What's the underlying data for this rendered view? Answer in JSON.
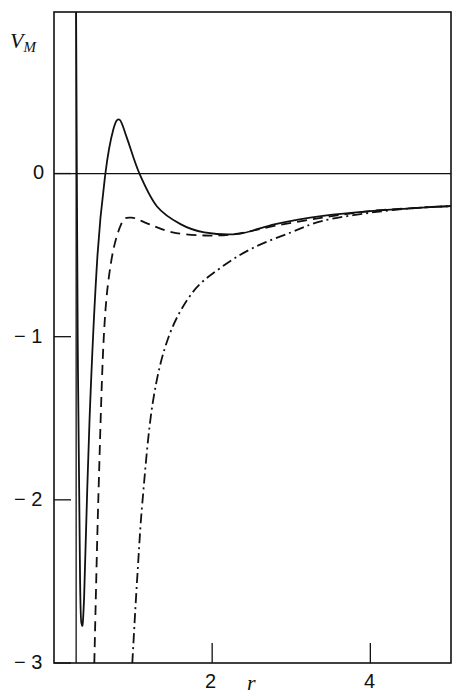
{
  "chart_data": {
    "type": "line",
    "title": "",
    "xlabel": "r",
    "ylabel": "V",
    "ylabel_subscript": "M",
    "xlim": [
      0,
      5.02
    ],
    "ylim": [
      -3,
      0.99
    ],
    "xticks": [
      2,
      4
    ],
    "xtick_labels": [
      "2",
      "4"
    ],
    "yticks": [
      0,
      -1,
      -2,
      -3
    ],
    "ytick_labels": [
      "0",
      "− 1",
      "− 2",
      "− 3"
    ],
    "grid": false,
    "legend": null,
    "annotations": [
      {
        "type": "vline",
        "x": 0.28,
        "style": "solid",
        "note": "hard-core wall"
      },
      {
        "type": "hline",
        "y": 0,
        "style": "solid"
      }
    ],
    "series": [
      {
        "name": "solid",
        "style": "solid",
        "points": [
          [
            0.28,
            0.99
          ],
          [
            0.3,
            -1.0
          ],
          [
            0.33,
            -2.5
          ],
          [
            0.35,
            -2.76
          ],
          [
            0.38,
            -2.6
          ],
          [
            0.45,
            -1.5
          ],
          [
            0.55,
            -0.5
          ],
          [
            0.65,
            0.0
          ],
          [
            0.75,
            0.27
          ],
          [
            0.83,
            0.33
          ],
          [
            0.92,
            0.22
          ],
          [
            1.08,
            0.0
          ],
          [
            1.3,
            -0.2
          ],
          [
            1.6,
            -0.31
          ],
          [
            1.9,
            -0.36
          ],
          [
            2.33,
            -0.37
          ],
          [
            2.8,
            -0.31
          ],
          [
            3.4,
            -0.26
          ],
          [
            4.0,
            -0.23
          ],
          [
            4.6,
            -0.21
          ],
          [
            5.02,
            -0.2
          ]
        ]
      },
      {
        "name": "dashed",
        "style": "dashed",
        "points": [
          [
            0.51,
            -3.0
          ],
          [
            0.56,
            -2.0
          ],
          [
            0.63,
            -1.0
          ],
          [
            0.72,
            -0.55
          ],
          [
            0.85,
            -0.31
          ],
          [
            0.98,
            -0.27
          ],
          [
            1.2,
            -0.31
          ],
          [
            1.5,
            -0.36
          ],
          [
            1.9,
            -0.38
          ],
          [
            2.3,
            -0.37
          ],
          [
            2.8,
            -0.32
          ],
          [
            3.4,
            -0.27
          ],
          [
            4.0,
            -0.23
          ],
          [
            4.6,
            -0.21
          ],
          [
            5.02,
            -0.2
          ]
        ]
      },
      {
        "name": "dash-dot",
        "style": "dashdot",
        "points": [
          [
            0.99,
            -3.0
          ],
          [
            1.05,
            -2.5
          ],
          [
            1.12,
            -2.0
          ],
          [
            1.25,
            -1.4
          ],
          [
            1.45,
            -1.0
          ],
          [
            1.75,
            -0.73
          ],
          [
            2.1,
            -0.58
          ],
          [
            2.5,
            -0.46
          ],
          [
            3.0,
            -0.36
          ],
          [
            3.4,
            -0.29
          ],
          [
            4.0,
            -0.24
          ],
          [
            4.6,
            -0.21
          ],
          [
            5.02,
            -0.2
          ]
        ]
      }
    ]
  },
  "labels": {
    "y0": "0",
    "y1": "− 1",
    "y2": "− 2",
    "y3": "− 3",
    "x2": "2",
    "x4": "4",
    "xaxis": "r",
    "yaxis_main": "V",
    "yaxis_sub": "M"
  }
}
